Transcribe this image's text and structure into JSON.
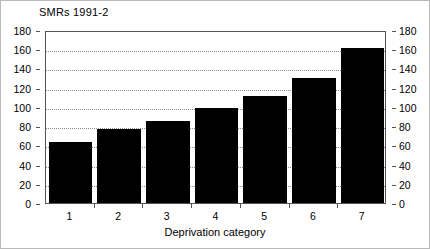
{
  "chart_data": {
    "type": "bar",
    "title": "SMRs 1991-2",
    "xlabel": "Deprivation category",
    "ylabel": "",
    "categories": [
      "1",
      "2",
      "3",
      "4",
      "5",
      "6",
      "7"
    ],
    "values": [
      64,
      77,
      85,
      99,
      111,
      130,
      161
    ],
    "ylim": [
      0,
      180
    ],
    "y_ticks": [
      0,
      20,
      40,
      60,
      80,
      100,
      120,
      140,
      160,
      180
    ],
    "y_tick_labels": [
      "0",
      "20",
      "40",
      "60",
      "80",
      "100",
      "120",
      "140",
      "160",
      "180"
    ],
    "right_axis": {
      "visible": true,
      "ylim": [
        0,
        180
      ],
      "y_ticks": [
        0,
        20,
        40,
        60,
        80,
        100,
        120,
        140,
        160,
        180
      ],
      "y_tick_labels": [
        "0",
        "20",
        "40",
        "60",
        "80",
        "100",
        "120",
        "140",
        "160",
        "180"
      ]
    },
    "grid": true,
    "grid_style": "dotted-horizontal",
    "legend": null,
    "legend_position": "none",
    "bar_color": "#000000",
    "axis_color": "#545454",
    "grid_color": "#8d8d8d",
    "background_color": "#ffffff"
  },
  "figure": {
    "title": "SMRs 1991-2",
    "x_axis_label": "Deprivation category"
  }
}
